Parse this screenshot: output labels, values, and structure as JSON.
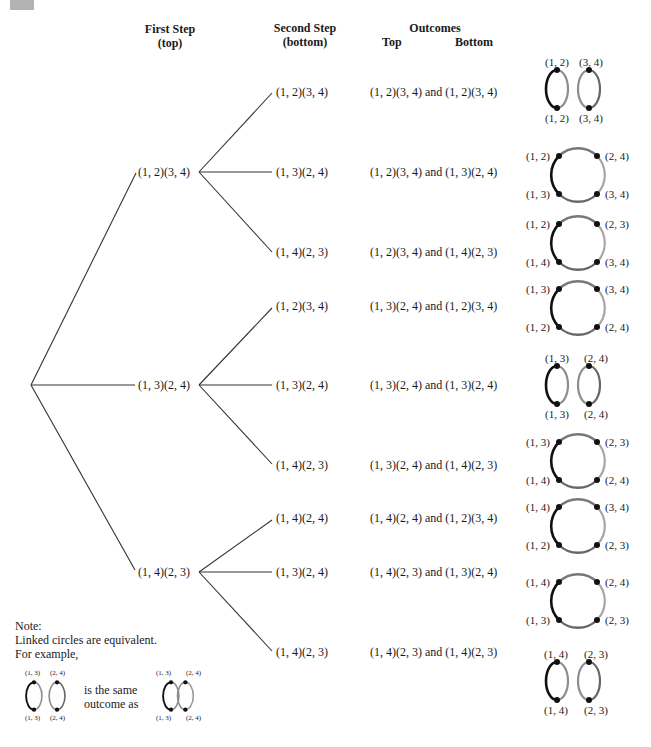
{
  "headers": {
    "first_step": "First Step",
    "first_step_sub": "(top)",
    "second_step": "Second Step",
    "second_step_sub": "(bottom)",
    "outcomes": "Outcomes",
    "outcomes_top": "Top",
    "outcomes_bottom": "Bottom"
  },
  "colors": {
    "dark_arc": "#111111",
    "mid_arc": "#666666",
    "light_arc": "#a6a6a6",
    "node": "#111111",
    "line": "#333333",
    "corner_box": "#b3b3b3"
  },
  "tree": {
    "first_level": [
      {
        "label": "(1, 2)(3, 4)",
        "children": [
          {
            "label": "(1, 2)(3, 4)",
            "outcome": "(1, 2)(3, 4) and (1, 2)(3, 4)"
          },
          {
            "label": "(1, 3)(2, 4)",
            "outcome": "(1, 2)(3, 4) and (1, 3)(2, 4)"
          },
          {
            "label": "(1, 4)(2, 3)",
            "outcome": "(1, 2)(3, 4) and (1, 4)(2, 3)"
          }
        ]
      },
      {
        "label": "(1, 3)(2, 4)",
        "children": [
          {
            "label": "(1, 2)(3, 4)",
            "outcome": "(1, 3)(2, 4) and (1, 2)(3, 4)"
          },
          {
            "label": "(1, 3)(2, 4)",
            "outcome": "(1, 3)(2, 4) and (1, 3)(2, 4)"
          },
          {
            "label": "(1, 4)(2, 3)",
            "outcome": "(1, 3)(2, 4) and (1, 4)(2, 3)"
          }
        ]
      },
      {
        "label": "(1, 4)(2, 3)",
        "children": [
          {
            "label": "(1, 4)(2, 4)",
            "outcome": "(1, 4)(2, 4) and (1, 2)(3, 4)"
          },
          {
            "label": "(1, 3)(2, 4)",
            "outcome": "(1, 4)(2, 3) and (1, 3)(2, 4)"
          },
          {
            "label": "(1, 4)(2, 3)",
            "outcome": "(1, 4)(2, 3) and (1, 4)(2, 3)"
          }
        ]
      }
    ]
  },
  "circles": [
    {
      "type": "pair",
      "tl": "(1, 2)",
      "tr": "(3, 4)",
      "bl": "(1, 2)",
      "br": "(3, 4)"
    },
    {
      "type": "ring",
      "tl": "(1, 2)",
      "tr": "(2, 4)",
      "bl": "(1, 3)",
      "br": "(3, 4)"
    },
    {
      "type": "ring",
      "tl": "(1, 2)",
      "tr": "(2, 3)",
      "bl": "(1, 4)",
      "br": "(3, 4)"
    },
    {
      "type": "ring",
      "tl": "(1, 3)",
      "tr": "(3, 4)",
      "bl": "(1, 2)",
      "br": "(2, 4)"
    },
    {
      "type": "pair",
      "tl": "(1, 3)",
      "tr": "(2, 4)",
      "bl": "(1, 3)",
      "br": "(2, 4)"
    },
    {
      "type": "ring",
      "tl": "(1, 3)",
      "tr": "(2, 3)",
      "bl": "(1, 4)",
      "br": "(2, 4)"
    },
    {
      "type": "ring",
      "tl": "(1, 4)",
      "tr": "(3, 4)",
      "bl": "(1, 2)",
      "br": "(2, 3)"
    },
    {
      "type": "ring",
      "tl": "(1, 4)",
      "tr": "(2, 4)",
      "bl": "(1, 3)",
      "br": "(2, 3)"
    },
    {
      "type": "pair",
      "tl": "(1, 4)",
      "tr": "(2, 3)",
      "bl": "(1, 4)",
      "br": "(2, 3)"
    }
  ],
  "note": {
    "line1": "Note:",
    "line2": "Linked circles are equivalent.",
    "line3": "For example,",
    "same_line1": "is the same",
    "same_line2": "outcome as",
    "ex_tl": "(1, 3)",
    "ex_tr": "(2, 4)",
    "ex_bl": "(1, 3)",
    "ex_br": "(2, 4)"
  }
}
